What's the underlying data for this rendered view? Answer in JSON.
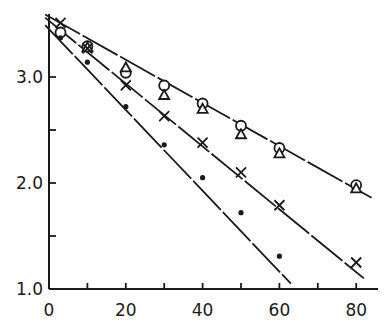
{
  "chart_data": {
    "type": "scatter",
    "title": "",
    "xlabel": "",
    "ylabel": "",
    "xlim": [
      0,
      85
    ],
    "ylim": [
      1.0,
      3.6
    ],
    "x_ticks": [
      0,
      10,
      20,
      30,
      40,
      50,
      60,
      70,
      80
    ],
    "x_tick_labels": [
      "0",
      "20",
      "40",
      "60",
      "80"
    ],
    "y_ticks": [
      1.0,
      1.5,
      2.0,
      2.5,
      3.0
    ],
    "y_tick_labels": [
      "1.0",
      "2.0",
      "3.0"
    ],
    "grid": false,
    "legend": null,
    "series": [
      {
        "name": "open circles",
        "marker": "circle-open",
        "x": [
          3,
          10,
          20,
          30,
          40,
          50,
          60,
          80
        ],
        "y": [
          3.42,
          3.29,
          3.04,
          2.92,
          2.75,
          2.54,
          2.33,
          1.98
        ]
      },
      {
        "name": "open triangles",
        "marker": "triangle-open",
        "x": [
          10,
          20,
          30,
          40,
          50,
          60,
          80
        ],
        "y": [
          3.28,
          3.09,
          2.83,
          2.7,
          2.46,
          2.28,
          1.95
        ]
      },
      {
        "name": "crosses",
        "marker": "x",
        "x": [
          3,
          10,
          20,
          30,
          40,
          50,
          60,
          80
        ],
        "y": [
          3.51,
          3.27,
          2.92,
          2.63,
          2.38,
          2.1,
          1.79,
          1.25
        ]
      },
      {
        "name": "filled dots",
        "marker": "dot-filled",
        "x": [
          3,
          10,
          20,
          30,
          40,
          50,
          60
        ],
        "y": [
          3.37,
          3.14,
          2.72,
          2.36,
          2.05,
          1.72,
          1.31
        ]
      }
    ],
    "fit_lines": [
      {
        "name": "circles/triangles fit",
        "style": "solid-broken",
        "x": [
          -1,
          84
        ],
        "y": [
          3.59,
          1.86
        ]
      },
      {
        "name": "crosses fit",
        "style": "solid-broken",
        "x": [
          -1,
          82
        ],
        "y": [
          3.56,
          1.1
        ]
      },
      {
        "name": "dots fit",
        "style": "solid-broken",
        "x": [
          -1,
          63
        ],
        "y": [
          3.49,
          1.05
        ]
      }
    ]
  },
  "colors": {
    "ink": "#1a1a1a",
    "background": "#ffffff"
  }
}
